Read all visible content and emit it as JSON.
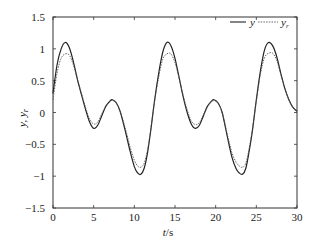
{
  "chart_data": {
    "type": "line",
    "title": "",
    "xlabel": "t/s",
    "ylabel": "y, y_r",
    "xlim": [
      0,
      30
    ],
    "ylim": [
      -1.5,
      1.5
    ],
    "xticks": [
      0,
      5,
      10,
      15,
      20,
      25,
      30
    ],
    "yticks": [
      -1.5,
      -1,
      -0.5,
      0,
      0.5,
      1,
      1.5
    ],
    "xtick_labels": [
      "0",
      "5",
      "10",
      "15",
      "20",
      "25",
      "30"
    ],
    "ytick_labels": [
      "−1.5",
      "−1",
      "−0.5",
      "0",
      "0.5",
      "1",
      "1.5"
    ],
    "grid": false,
    "legend_position": "upper right",
    "series": [
      {
        "name": "y",
        "style": "solid",
        "x": [
          0,
          0.5,
          1.0,
          1.5,
          2.0,
          2.5,
          3.0,
          3.5,
          4.0,
          4.5,
          5.0,
          5.5,
          6.0,
          6.5,
          7.0,
          7.3,
          7.8,
          8.3,
          9.0,
          9.5,
          10.0,
          10.4,
          10.8,
          11.2,
          11.6,
          12.0,
          12.5,
          13.0,
          13.5,
          14.0,
          14.5,
          15.0,
          15.5,
          16.0,
          16.5,
          17.0,
          17.5,
          18.0,
          18.5,
          19.0,
          19.5,
          19.8,
          20.3,
          20.8,
          21.5,
          22.0,
          22.5,
          22.9,
          23.3,
          23.7,
          24.1,
          24.5,
          25.0,
          25.5,
          26.0,
          26.5,
          27.0,
          27.5,
          28.0,
          28.5,
          29.0,
          29.5,
          30.0
        ],
        "values": [
          0.3,
          0.75,
          1.0,
          1.1,
          1.02,
          0.8,
          0.52,
          0.28,
          0.05,
          -0.15,
          -0.25,
          -0.2,
          -0.05,
          0.1,
          0.18,
          0.2,
          0.15,
          0.0,
          -0.35,
          -0.62,
          -0.85,
          -0.95,
          -0.97,
          -0.88,
          -0.65,
          -0.3,
          0.2,
          0.62,
          0.95,
          1.1,
          1.05,
          0.85,
          0.55,
          0.25,
          0.0,
          -0.18,
          -0.25,
          -0.2,
          -0.05,
          0.1,
          0.18,
          0.2,
          0.15,
          0.0,
          -0.42,
          -0.7,
          -0.88,
          -0.95,
          -0.97,
          -0.88,
          -0.62,
          -0.3,
          0.2,
          0.65,
          0.98,
          1.1,
          1.05,
          0.88,
          0.62,
          0.38,
          0.2,
          0.08,
          0.02
        ]
      },
      {
        "name": "y_r",
        "style": "dashed",
        "x": [
          0,
          0.5,
          1.0,
          1.5,
          2.0,
          2.5,
          3.0,
          3.5,
          4.0,
          4.5,
          5.0,
          5.5,
          6.0,
          6.5,
          7.0,
          7.3,
          7.8,
          8.3,
          9.0,
          9.5,
          10.0,
          10.4,
          10.8,
          11.2,
          11.6,
          12.0,
          12.5,
          13.0,
          13.5,
          14.0,
          14.5,
          15.0,
          15.5,
          16.0,
          16.5,
          17.0,
          17.5,
          18.0,
          18.5,
          19.0,
          19.5,
          19.8,
          20.3,
          20.8,
          21.5,
          22.0,
          22.5,
          22.9,
          23.3,
          23.7,
          24.1,
          24.5,
          25.0,
          25.5,
          26.0,
          26.5,
          27.0,
          27.5,
          28.0,
          28.5,
          29.0,
          29.5,
          30.0
        ],
        "values": [
          0.2,
          0.62,
          0.85,
          0.92,
          0.9,
          0.75,
          0.52,
          0.3,
          0.08,
          -0.1,
          -0.18,
          -0.15,
          -0.02,
          0.1,
          0.17,
          0.19,
          0.14,
          0.0,
          -0.3,
          -0.55,
          -0.75,
          -0.84,
          -0.86,
          -0.8,
          -0.6,
          -0.28,
          0.18,
          0.56,
          0.84,
          0.92,
          0.92,
          0.78,
          0.54,
          0.27,
          0.04,
          -0.13,
          -0.19,
          -0.16,
          -0.03,
          0.1,
          0.17,
          0.19,
          0.14,
          0.0,
          -0.38,
          -0.63,
          -0.78,
          -0.84,
          -0.86,
          -0.8,
          -0.58,
          -0.28,
          0.18,
          0.6,
          0.86,
          0.93,
          0.93,
          0.82,
          0.6,
          0.38,
          0.2,
          0.08,
          0.02
        ]
      }
    ]
  },
  "legend": {
    "items": [
      {
        "label": "y",
        "style": "solid"
      },
      {
        "label": "y",
        "subscript": "r",
        "style": "dashed"
      }
    ]
  },
  "axes": {
    "xlabel_italic": "t",
    "xlabel_unit": "/s",
    "ylabel_main": "y, y",
    "ylabel_sub": "r"
  }
}
